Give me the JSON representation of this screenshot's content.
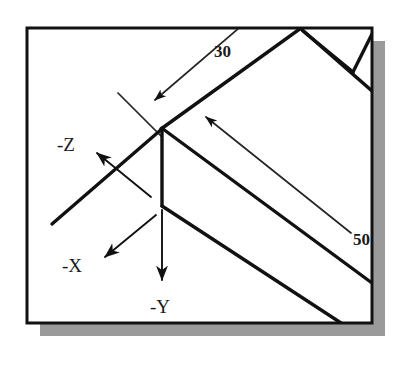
{
  "figure": {
    "kind": "isometric-technical-drawing",
    "caption": "",
    "canvas": {
      "width": 404,
      "height": 365,
      "background_color": "#ffffff"
    },
    "frame": {
      "name": "drawing-border",
      "x": 27,
      "y": 28,
      "width": 345,
      "height": 295,
      "stroke_color": "#111111",
      "stroke_width": 3,
      "fill_color": "#ffffff"
    },
    "shadow": {
      "name": "drop-shadow",
      "color": "#9a9a9a",
      "offset_x": 13,
      "offset_y": 13
    },
    "colors": {
      "ink": "#111111",
      "thin_ink": "#242424",
      "paper": "#ffffff",
      "shadow": "#9a9a9a"
    }
  },
  "dimensions": [
    {
      "id": "dim-30",
      "label": "30",
      "value": 30,
      "text_x": 214,
      "text_y": 57,
      "font_size": 17
    },
    {
      "id": "dim-50",
      "label": "50",
      "value": 50,
      "text_x": 353,
      "text_y": 245,
      "font_size": 17,
      "clipped_by_frame": true
    }
  ],
  "axes": [
    {
      "id": "axis-neg-z",
      "label": "-Z",
      "text_x": 57,
      "text_y": 151,
      "font_size": 19,
      "arrow_tip_x": 96,
      "arrow_tip_y": 152,
      "arrow_tail_x": 150,
      "arrow_tail_y": 196
    },
    {
      "id": "axis-neg-x",
      "label": "-X",
      "text_x": 62,
      "text_y": 272,
      "font_size": 19,
      "arrow_tip_x": 104,
      "arrow_tip_y": 258,
      "arrow_tail_x": 155,
      "arrow_tail_y": 216
    },
    {
      "id": "axis-neg-y",
      "label": "-Y",
      "text_x": 150,
      "text_y": 313,
      "font_size": 19,
      "arrow_tip_x": 162,
      "arrow_tip_y": 281,
      "arrow_tail_x": 162,
      "arrow_tail_y": 210
    }
  ],
  "solid_edges": [
    {
      "id": "edge-center-vertical",
      "x1": 162,
      "y1": 128,
      "x2": 162,
      "y2": 206
    },
    {
      "id": "edge-top-left-diagonal",
      "x1": 162,
      "y1": 128,
      "x2": 54,
      "y2": 222
    },
    {
      "id": "edge-top-right-diagonal",
      "x1": 162,
      "y1": 128,
      "x2": 300,
      "y2": 28
    },
    {
      "id": "edge-mid-right-diagonal",
      "x1": 162,
      "y1": 128,
      "x2": 371,
      "y2": 282
    },
    {
      "id": "edge-lower-right-diagonal",
      "x1": 162,
      "y1": 206,
      "x2": 340,
      "y2": 322
    },
    {
      "id": "edge-upper-far-diagonal",
      "x1": 300,
      "y1": 28,
      "x2": 371,
      "y2": 90
    },
    {
      "id": "edge-notch-left",
      "x1": 302,
      "y1": 30,
      "x2": 352,
      "y2": 71
    },
    {
      "id": "edge-notch-right",
      "x1": 352,
      "y1": 71,
      "x2": 371,
      "y2": 33
    }
  ],
  "dimension_lines": [
    {
      "id": "leader-30",
      "x1": 238,
      "y1": 28,
      "x2": 153,
      "y2": 101,
      "arrow_at": "end"
    },
    {
      "id": "extension-30",
      "x1": 119,
      "y1": 95,
      "x2": 160,
      "y2": 135
    },
    {
      "id": "leader-50",
      "x1": 205,
      "y1": 116,
      "x2": 350,
      "y2": 232,
      "arrow_at": "start"
    }
  ]
}
